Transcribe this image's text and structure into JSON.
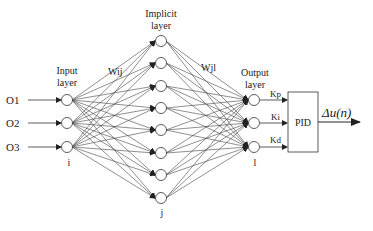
{
  "diagram": {
    "layers": {
      "input": {
        "title_line1": "Input",
        "title_line2": "layer",
        "index": "i",
        "inputs": [
          "O1",
          "O2",
          "O3"
        ]
      },
      "hidden": {
        "title_line1": "Implicit",
        "title_line2": "layer",
        "index": "j",
        "node_count": 8
      },
      "output": {
        "title_line1": "Output",
        "title_line2": "layer",
        "index": "l",
        "outputs": [
          "Kp",
          "Ki",
          "Kd"
        ]
      }
    },
    "weights": {
      "input_hidden": "Wij",
      "hidden_output": "Wjl"
    },
    "controller": {
      "label": "PID",
      "output": "Δu(n)"
    },
    "colors": {
      "line": "#333333",
      "node_fill": "#ffffff",
      "text": "#222222"
    }
  }
}
